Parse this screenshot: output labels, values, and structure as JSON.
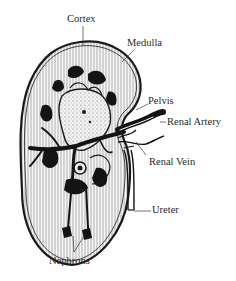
{
  "diagram": {
    "labels": {
      "cortex": "Cortex",
      "medulla": "Medulla",
      "pelvis": "Pelvis",
      "renal_artery": "Renal Artery",
      "renal_vein": "Renal Vein",
      "ureter": "Ureter",
      "nephrons": "Nephrons"
    },
    "colors": {
      "ink": "#1a1a1a",
      "background": "#ffffff",
      "tissue_fill": "#f4f4f4"
    }
  }
}
